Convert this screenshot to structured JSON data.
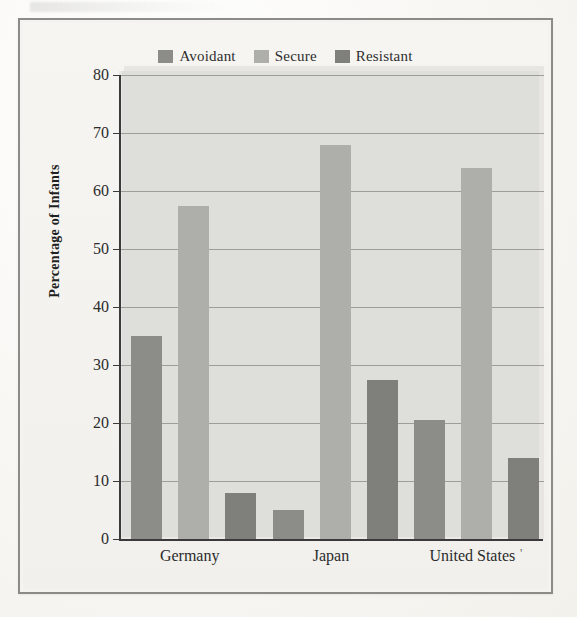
{
  "figure": {
    "y_axis_title": "Percentage of Infants",
    "legend": [
      {
        "label": "Avoidant",
        "color": "#8c8c89"
      },
      {
        "label": "Secure",
        "color": "#aeaeaa"
      },
      {
        "label": "Resistant",
        "color": "#7f7f7c"
      }
    ],
    "y_ticks": [
      "0",
      "10",
      "20",
      "30",
      "40",
      "50",
      "60",
      "70",
      "80"
    ],
    "x_categories": [
      "Germany",
      "Japan",
      "United States"
    ],
    "colors": {
      "frame_border": "#8b8b88",
      "plot_panel": "#dededa",
      "gridline": "#9e9e99",
      "axis": "#3a3a3a",
      "page_background": "#f4f3ef",
      "text": "#2b2b2b"
    }
  },
  "chart_data": {
    "type": "bar",
    "title": "",
    "subtitle": "",
    "xlabel": "",
    "ylabel": "Percentage of Infants",
    "ylim": [
      0,
      80
    ],
    "ytick_step": 10,
    "grid": true,
    "legend_position": "top-center",
    "categories": [
      "Germany",
      "Japan",
      "United States"
    ],
    "series": [
      {
        "name": "Avoidant",
        "color": "#8c8c89",
        "values": [
          35.0,
          5.0,
          20.5
        ]
      },
      {
        "name": "Secure",
        "color": "#aeaeaa",
        "values": [
          57.5,
          68.0,
          64.0
        ]
      },
      {
        "name": "Resistant",
        "color": "#7f7f7c",
        "values": [
          8.0,
          27.5,
          14.0
        ]
      }
    ]
  }
}
